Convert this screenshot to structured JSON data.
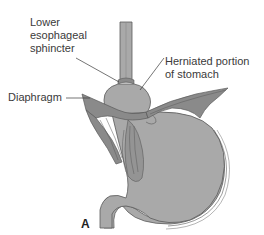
{
  "figure": {
    "panel_label": "A",
    "labels": {
      "lower_esophageal_sphincter": "Lower\nesophageal\nsphincter",
      "herniated_portion": "Herniated portion\nof stomach",
      "diaphragm": "Diaphragm"
    },
    "colors": {
      "tissue_fill": "#a9a9a9",
      "tissue_dark": "#8a8a8a",
      "outline": "#5a5a5a",
      "label_text": "#3a3a3a",
      "background": "#ffffff"
    }
  }
}
